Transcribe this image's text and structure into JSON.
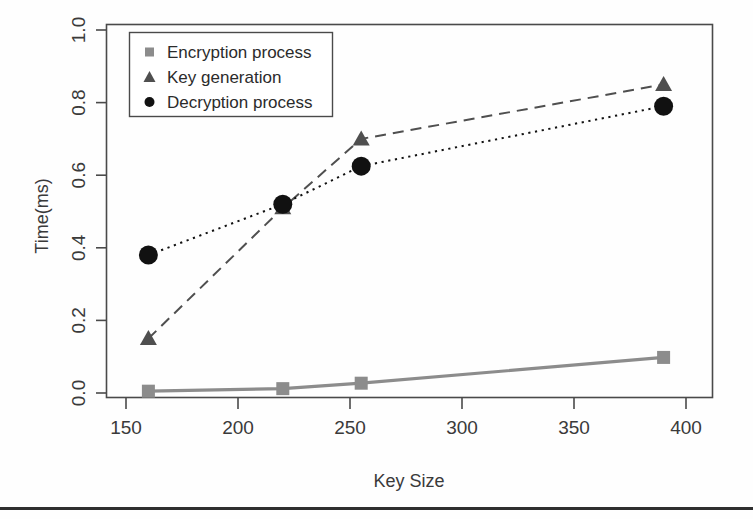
{
  "chart_data": {
    "type": "line",
    "title": "",
    "xlabel": "Key Size",
    "ylabel": "Time(ms)",
    "xlim": [
      143,
      405
    ],
    "ylim": [
      -0.04,
      1.04
    ],
    "xticks": [
      "150",
      "200",
      "250",
      "300",
      "350",
      "400"
    ],
    "xtick_values": [
      150,
      200,
      250,
      300,
      350,
      400
    ],
    "yticks": [
      "0.0",
      "0.2",
      "0.4",
      "0.6",
      "0.8",
      "1.0"
    ],
    "ytick_values": [
      0.0,
      0.2,
      0.4,
      0.6,
      0.8,
      1.0
    ],
    "grid": false,
    "legend_position": "top-left",
    "x": [
      160,
      220,
      255,
      390
    ],
    "series": [
      {
        "name": "Encryption process",
        "marker": "square",
        "line_style": "solid",
        "color": "#8c8c8c",
        "values": [
          0.005,
          0.012,
          0.027,
          0.098
        ]
      },
      {
        "name": "Key generation",
        "marker": "triangle",
        "line_style": "dashed",
        "color": "#4f4f4f",
        "values": [
          0.15,
          0.51,
          0.7,
          0.85
        ]
      },
      {
        "name": "Decryption process",
        "marker": "circle",
        "line_style": "dotted",
        "color": "#111111",
        "values": [
          0.38,
          0.52,
          0.625,
          0.79
        ]
      }
    ]
  },
  "legend": {
    "items": [
      {
        "label": "Encryption process",
        "marker": "square-marker"
      },
      {
        "label": "Key generation",
        "marker": "triangle-marker"
      },
      {
        "label": "Decryption process",
        "marker": "circle-marker"
      }
    ]
  },
  "axes": {
    "x_title": "Key Size",
    "y_title": "Time(ms)",
    "x_tick_labels": [
      "150",
      "200",
      "250",
      "300",
      "350",
      "400"
    ],
    "y_tick_labels": [
      "0.0",
      "0.2",
      "0.4",
      "0.6",
      "0.8",
      "1.0"
    ]
  },
  "colors": {
    "frame": "#4a4a4a",
    "encryption": "#8c8c8c",
    "keygen": "#4f4f4f",
    "decryption": "#111111",
    "text": "#3a3a3a",
    "rule": "#2f2f2f"
  }
}
